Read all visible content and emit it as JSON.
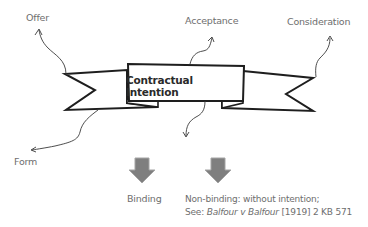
{
  "diagram": {
    "center": {
      "title": "Contractual Intention"
    },
    "elements": [
      {
        "id": "offer",
        "label": "Offer"
      },
      {
        "id": "acceptance",
        "label": "Acceptance"
      },
      {
        "id": "consideration",
        "label": "Consideration"
      },
      {
        "id": "form",
        "label": "Form"
      }
    ],
    "outcomes": [
      {
        "id": "binding",
        "label": "Binding"
      },
      {
        "id": "non-binding",
        "line1": "Non-binding: without intention;",
        "line2_prefix": "See: ",
        "case_name": "Balfour v Balfour",
        "citation": " [1919] 2 KB 571"
      }
    ],
    "colors": {
      "outline": "#1e1e1e",
      "label_text": "#6e6e6e",
      "arrow_fill": "#7f7f7f",
      "arrow_stroke": "#a5a5a5"
    }
  }
}
